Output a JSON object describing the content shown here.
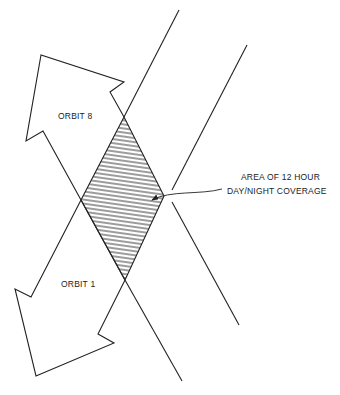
{
  "labels": {
    "orbit_upper": "ORBIT 8",
    "orbit_lower": "ORBIT 1",
    "annotation_line1": "AREA OF 12 HOUR",
    "annotation_line2": "DAY/NIGHT COVERAGE"
  },
  "colors": {
    "stroke": "#222222",
    "background": "#ffffff"
  },
  "shapes": {
    "upper_arrow": "orbit-8 direction arrow pointing up-left",
    "lower_arrow": "orbit-1 direction arrow pointing down-left",
    "overlap_region": "hatched diamond where swaths overlap"
  }
}
